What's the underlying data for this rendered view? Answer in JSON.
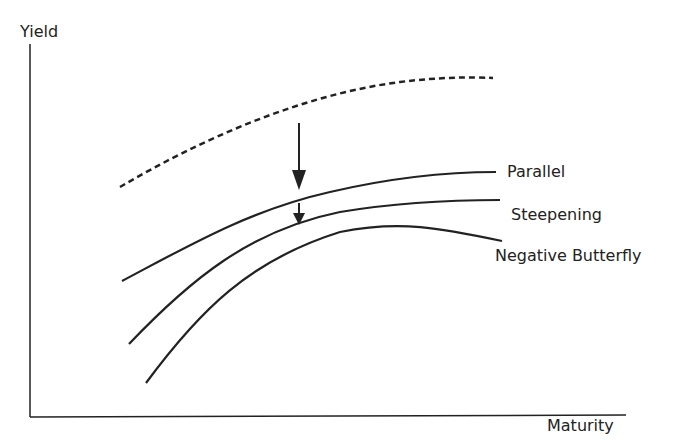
{
  "axes": {
    "y_label": "Yield",
    "x_label": "Maturity"
  },
  "curves": [
    {
      "name": "Initial",
      "style": "dashed",
      "label": ""
    },
    {
      "name": "Parallel",
      "style": "solid",
      "label": "Parallel"
    },
    {
      "name": "Steepening",
      "style": "solid",
      "label": "Steepening"
    },
    {
      "name": "Negative Butterfly",
      "style": "solid",
      "label": "Negative Butterfly"
    }
  ],
  "arrows": [
    {
      "from": "Initial",
      "to": "Parallel",
      "direction": "down"
    },
    {
      "from": "Parallel",
      "to": "Steepening",
      "direction": "down"
    }
  ],
  "colors": {
    "line": "#222222",
    "background": "#ffffff"
  }
}
